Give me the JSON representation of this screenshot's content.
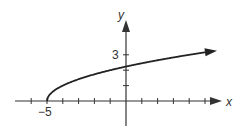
{
  "chart_data": {
    "type": "line",
    "title": "",
    "function": "y = sqrt(x + 5)",
    "xlabel": "x",
    "ylabel": "y",
    "x_tick_labels": [
      {
        "value": -5,
        "label": "−5"
      }
    ],
    "y_tick_labels": [
      {
        "value": 3,
        "label": "3"
      }
    ],
    "xlim": [
      -7,
      6
    ],
    "ylim": [
      -2,
      5
    ],
    "x_ticks": [
      -6,
      -5,
      -4,
      -3,
      -2,
      -1,
      1,
      2,
      3,
      4,
      5
    ],
    "y_ticks": [
      1,
      2,
      3
    ],
    "series": [
      {
        "name": "sqrt(x+5)",
        "x": [
          -5,
          -4,
          -3,
          -1,
          0,
          2,
          4,
          5.2
        ],
        "y": [
          0,
          1,
          1.41,
          2.45,
          2.24,
          2.65,
          3,
          3.19
        ],
        "start_point": [
          -5,
          0
        ],
        "arrow_end": true
      }
    ],
    "grid": false,
    "legend": "none"
  },
  "labels": {
    "x_axis": "x",
    "y_axis": "y",
    "x_neg5": "−5",
    "y_3": "3"
  },
  "colors": {
    "axis": "#333333",
    "curve": "#222222"
  }
}
